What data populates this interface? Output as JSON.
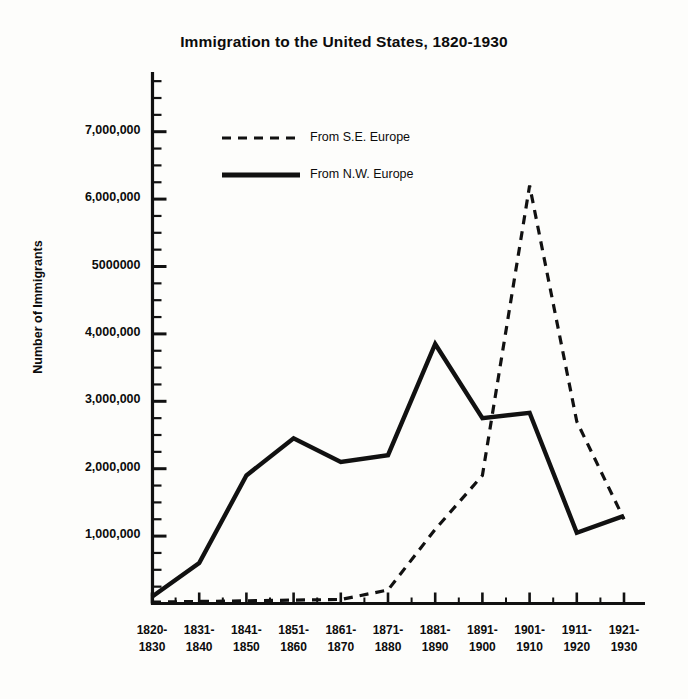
{
  "chart_data": {
    "type": "line",
    "title": "Immigration to the United States, 1820-1930",
    "xlabel": "",
    "ylabel": "Number of Immigrants",
    "grid": false,
    "legend_position": "upper-left-inside",
    "ylim": [
      0,
      9000000
    ],
    "ytick_labels": [
      "1,000,000",
      "2,000,000",
      "3,000,000",
      "4,000,000",
      "5000000",
      "6,000,000",
      "7,000,000"
    ],
    "ytick_values": [
      1000000,
      2000000,
      3000000,
      4000000,
      5000000,
      6000000,
      7000000
    ],
    "minor_tick_interval": 250000,
    "categories": [
      "1820-1830",
      "1831-1840",
      "1841-1850",
      "1851-1860",
      "1861-1870",
      "1871-1880",
      "1881-1890",
      "1891-1900",
      "1901-1910",
      "1911-1920",
      "1921-1930"
    ],
    "category_lines": [
      [
        "1820-",
        "1830"
      ],
      [
        "1831-",
        "1840"
      ],
      [
        "1841-",
        "1850"
      ],
      [
        "1851-",
        "1860"
      ],
      [
        "1861-",
        "1870"
      ],
      [
        "1871-",
        "1880"
      ],
      [
        "1881-",
        "1890"
      ],
      [
        "1891-",
        "1900"
      ],
      [
        "1901-",
        "1910"
      ],
      [
        "1911-",
        "1920"
      ],
      [
        "1921-",
        "1930"
      ]
    ],
    "series": [
      {
        "name": "From S.E. Europe",
        "style": "dashed",
        "color": "#111111",
        "values": [
          20000,
          30000,
          40000,
          50000,
          60000,
          200000,
          1100000,
          1900000,
          6200000,
          2700000,
          1250000
        ]
      },
      {
        "name": "From N.W. Europe",
        "style": "solid",
        "color": "#111111",
        "values": [
          100000,
          600000,
          1900000,
          2450000,
          2100000,
          2200000,
          3850000,
          2750000,
          2830000,
          1050000,
          1300000
        ]
      }
    ],
    "annotations": {
      "se_europe_peak_decade": "1901-1910",
      "se_europe_peak_value": 6200000,
      "nw_europe_peak_decade": "1881-1890",
      "nw_europe_peak_value": 3850000
    }
  },
  "legend": {
    "entries": [
      {
        "label": "From S.E. Europe",
        "style": "dashed"
      },
      {
        "label": "From N.W. Europe",
        "style": "solid"
      }
    ]
  }
}
